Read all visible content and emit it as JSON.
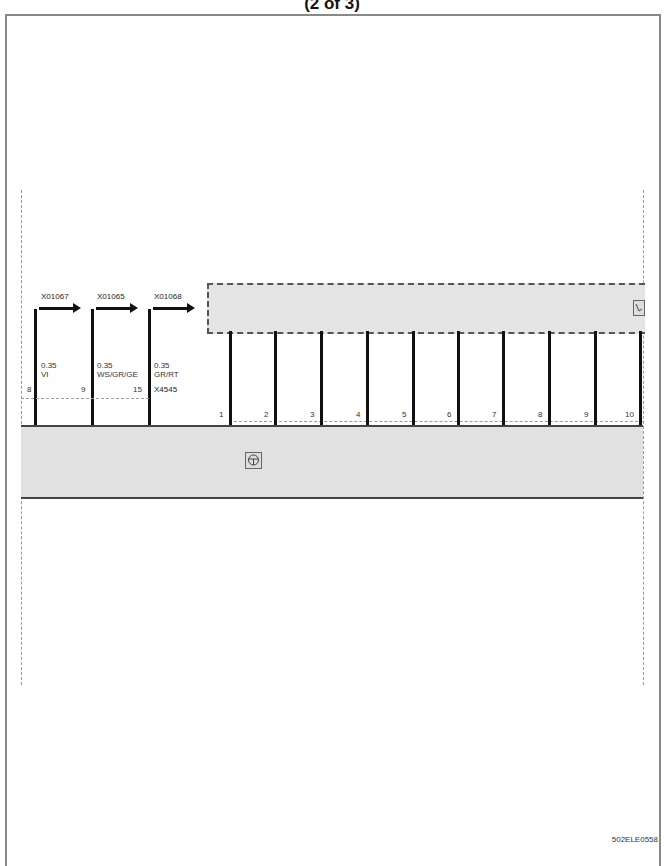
{
  "header": {
    "title": "(2 of 3)"
  },
  "footer": {
    "figure_id": "502ELE0558"
  },
  "connectors_out": [
    {
      "id": "X01067",
      "pin": "8",
      "gauge": "0.35",
      "color": "VI"
    },
    {
      "id": "X01065",
      "pin": "9",
      "gauge": "0.35",
      "color": "WS/GR/GE"
    },
    {
      "id": "X01068",
      "pin": "15",
      "gauge": "0.35",
      "color": "GR/RT",
      "connector": "X4545"
    }
  ],
  "lower_pins": [
    "1",
    "2",
    "3",
    "4",
    "5",
    "6",
    "7",
    "8",
    "9",
    "10"
  ],
  "icons": {
    "upper_component": "component-symbol-icon",
    "lower_component": "module-symbol-icon"
  }
}
